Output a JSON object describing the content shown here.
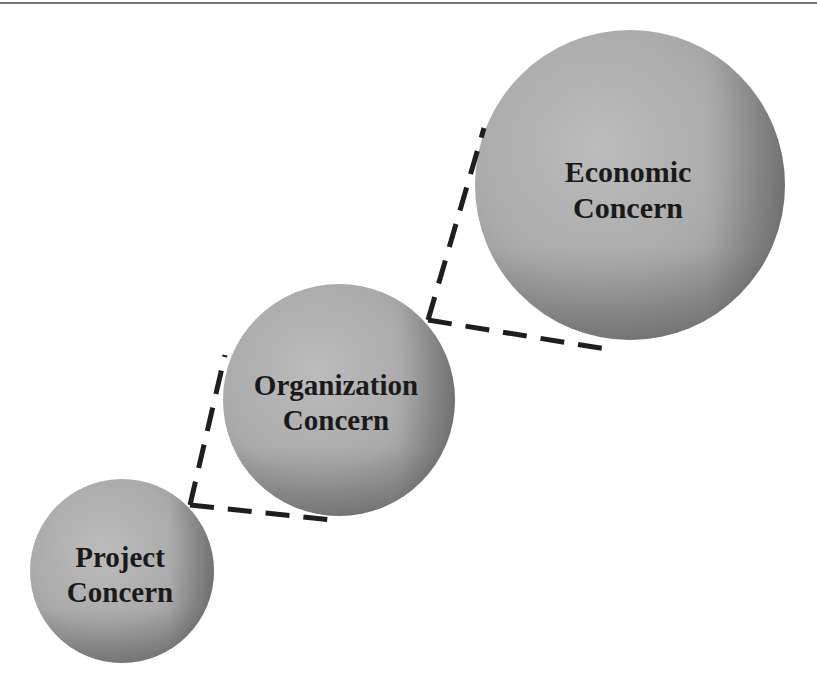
{
  "diagram": {
    "type": "nested-concern-spheres",
    "colors": {
      "sphere_base": "#a9a9a9",
      "sphere_light": "#bdbdbd",
      "sphere_shadow": "#6e6e6e",
      "dash": "#1e1e1e",
      "text": "#1a1a1a",
      "top_rule": "#777777"
    },
    "nodes": [
      {
        "id": "economic",
        "line1": "Economic",
        "line2": "Concern"
      },
      {
        "id": "organization",
        "line1": "Organization",
        "line2": "Concern"
      },
      {
        "id": "project",
        "line1": "Project",
        "line2": "Concern"
      }
    ],
    "connectors": [
      {
        "from": "organization",
        "to": "economic",
        "style": "dashed-corner"
      },
      {
        "from": "project",
        "to": "organization",
        "style": "dashed-corner"
      }
    ]
  }
}
